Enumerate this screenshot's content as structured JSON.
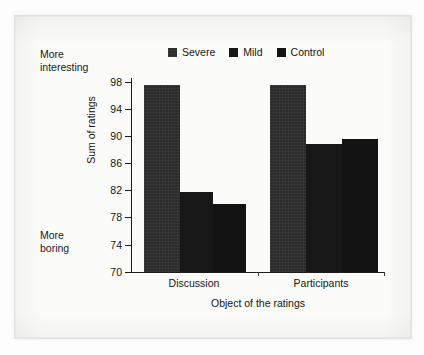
{
  "figure": {
    "background_color": "#fbfbfa",
    "frame_color": "#e2e2e0"
  },
  "annotations": {
    "top_left": "More\ninteresting",
    "bottom_left": "More\nboring"
  },
  "legend": {
    "position": "top-center",
    "entries": [
      {
        "label": "Severe",
        "color": "#2b2b2b"
      },
      {
        "label": "Mild",
        "color": "#171717"
      },
      {
        "label": "Control",
        "color": "#131313"
      }
    ]
  },
  "axes": {
    "y_title": "Sum of ratings",
    "x_title": "Object of the ratings",
    "y_ticks": [
      "98",
      "94",
      "90",
      "86",
      "82",
      "78",
      "74",
      "70"
    ],
    "x_categories": [
      "Discussion",
      "Participants"
    ]
  },
  "chart_data": {
    "type": "bar",
    "title": "",
    "subtitle": "",
    "xlabel": "Object of the ratings",
    "ylabel": "Sum of ratings",
    "categories": [
      "Discussion",
      "Participants"
    ],
    "series": [
      {
        "name": "Severe",
        "values": [
          97.5,
          97.6
        ],
        "color": "#2b2b2b"
      },
      {
        "name": "Mild",
        "values": [
          81.8,
          88.8
        ],
        "color": "#171717"
      },
      {
        "name": "Control",
        "values": [
          80.0,
          89.6
        ],
        "color": "#131313"
      }
    ],
    "ylim": [
      70,
      98
    ],
    "ytick_values": [
      70,
      74,
      78,
      82,
      86,
      90,
      94,
      98
    ],
    "ytick_step": 4,
    "grid": false,
    "legend_position": "top-center",
    "annotations": [
      {
        "text": "More interesting",
        "position": "upper-left-outside"
      },
      {
        "text": "More boring",
        "position": "lower-left-outside"
      }
    ]
  }
}
